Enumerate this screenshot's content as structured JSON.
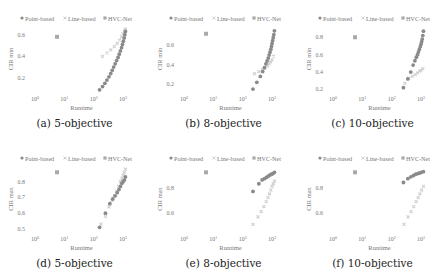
{
  "legend": {
    "items": [
      {
        "label": "Point-based",
        "color": "#8a8a8a",
        "marker": "circle"
      },
      {
        "label": "Line-based",
        "color": "#cfcfcf",
        "marker": "x"
      },
      {
        "label": "HVC-Net",
        "color": "#a9a9a9",
        "marker": "square"
      }
    ]
  },
  "colors": {
    "point": "#8a8a8a",
    "line": "#cfcfcf",
    "hvc": "#a9a9a9",
    "axis_text": "#777777",
    "caption": "#222222"
  },
  "chart_data": [
    {
      "id": "a",
      "caption": "(a) 5-objective",
      "type": "scatter",
      "xlabel": "Runtime",
      "ylabel": "CIR min",
      "xscale": "log",
      "xticks": [
        "10^0",
        "10^1",
        "10^2",
        "10^3"
      ],
      "xlim": [
        0,
        3.1
      ],
      "yticks": [
        0.2,
        0.4,
        0.6
      ],
      "ylim": [
        0.07,
        0.68
      ],
      "series": [
        {
          "name": "Point-based",
          "points": [
            [
              2.2,
              0.09
            ],
            [
              2.3,
              0.12
            ],
            [
              2.38,
              0.15
            ],
            [
              2.45,
              0.18
            ],
            [
              2.52,
              0.21
            ],
            [
              2.58,
              0.24
            ],
            [
              2.63,
              0.27
            ],
            [
              2.68,
              0.3
            ],
            [
              2.73,
              0.33
            ],
            [
              2.78,
              0.36
            ],
            [
              2.83,
              0.39
            ],
            [
              2.87,
              0.42
            ],
            [
              2.91,
              0.45
            ],
            [
              2.95,
              0.48
            ],
            [
              2.98,
              0.51
            ],
            [
              3.01,
              0.54
            ],
            [
              3.04,
              0.57
            ],
            [
              3.06,
              0.6
            ],
            [
              3.08,
              0.63
            ]
          ]
        },
        {
          "name": "Line-based",
          "points": [
            [
              2.3,
              0.4
            ],
            [
              2.45,
              0.43
            ],
            [
              2.58,
              0.46
            ],
            [
              2.7,
              0.49
            ],
            [
              2.8,
              0.52
            ],
            [
              2.88,
              0.55
            ],
            [
              2.95,
              0.58
            ],
            [
              3.0,
              0.61
            ],
            [
              3.05,
              0.63
            ],
            [
              3.08,
              0.65
            ]
          ]
        },
        {
          "name": "HVC-Net",
          "points": [
            [
              0.75,
              0.58
            ]
          ]
        }
      ]
    },
    {
      "id": "b",
      "caption": "(b) 8-objective",
      "type": "scatter",
      "xlabel": "Runtime",
      "ylabel": "CIR min",
      "xscale": "log",
      "xticks": [
        "10^0",
        "10^1",
        "10^2",
        "10^3"
      ],
      "xlim": [
        0,
        3.1
      ],
      "yticks": [
        0.2,
        0.4,
        0.6
      ],
      "ylim": [
        0.12,
        0.8
      ],
      "series": [
        {
          "name": "Point-based",
          "points": [
            [
              2.35,
              0.15
            ],
            [
              2.48,
              0.22
            ],
            [
              2.6,
              0.28
            ],
            [
              2.68,
              0.33
            ],
            [
              2.74,
              0.37
            ],
            [
              2.79,
              0.41
            ],
            [
              2.83,
              0.44
            ],
            [
              2.87,
              0.47
            ],
            [
              2.9,
              0.5
            ],
            [
              2.93,
              0.53
            ],
            [
              2.96,
              0.56
            ],
            [
              2.98,
              0.59
            ],
            [
              3.0,
              0.62
            ],
            [
              3.02,
              0.65
            ],
            [
              3.04,
              0.68
            ],
            [
              3.06,
              0.71
            ],
            [
              3.08,
              0.75
            ]
          ]
        },
        {
          "name": "Line-based",
          "points": [
            [
              2.4,
              0.31
            ],
            [
              2.55,
              0.33
            ],
            [
              2.67,
              0.35
            ],
            [
              2.76,
              0.37
            ],
            [
              2.84,
              0.39
            ],
            [
              2.9,
              0.41
            ],
            [
              2.95,
              0.43
            ],
            [
              3.0,
              0.45
            ],
            [
              3.05,
              0.49
            ]
          ]
        },
        {
          "name": "HVC-Net",
          "points": [
            [
              0.75,
              0.72
            ]
          ]
        }
      ]
    },
    {
      "id": "c",
      "caption": "(c) 10-objective",
      "type": "scatter",
      "xlabel": "Runtime",
      "ylabel": "CIR min",
      "xscale": "log",
      "xticks": [
        "10^0",
        "10^1",
        "10^2",
        "10^3"
      ],
      "xlim": [
        0,
        3.1
      ],
      "yticks": [
        0.2,
        0.4,
        0.6,
        0.8
      ],
      "ylim": [
        0.17,
        0.93
      ],
      "series": [
        {
          "name": "Point-based",
          "points": [
            [
              2.4,
              0.22
            ],
            [
              2.55,
              0.32
            ],
            [
              2.65,
              0.4
            ],
            [
              2.73,
              0.48
            ],
            [
              2.79,
              0.53
            ],
            [
              2.84,
              0.57
            ],
            [
              2.88,
              0.6
            ],
            [
              2.91,
              0.63
            ],
            [
              2.94,
              0.66
            ],
            [
              2.97,
              0.69
            ],
            [
              3.0,
              0.72
            ],
            [
              3.02,
              0.75
            ],
            [
              3.04,
              0.78
            ],
            [
              3.06,
              0.82
            ],
            [
              3.08,
              0.87
            ]
          ]
        },
        {
          "name": "Line-based",
          "points": [
            [
              2.45,
              0.27
            ],
            [
              2.58,
              0.33
            ],
            [
              2.7,
              0.35
            ],
            [
              2.8,
              0.37
            ],
            [
              2.88,
              0.39
            ],
            [
              2.95,
              0.41
            ],
            [
              3.0,
              0.42
            ],
            [
              3.06,
              0.44
            ]
          ]
        },
        {
          "name": "HVC-Net",
          "points": [
            [
              0.75,
              0.8
            ]
          ]
        }
      ]
    },
    {
      "id": "d",
      "caption": "(d) 5-objective",
      "type": "scatter",
      "xlabel": "Runtime",
      "ylabel": "CIR max",
      "xscale": "log",
      "xticks": [
        "10^0",
        "10^1",
        "10^2",
        "10^3"
      ],
      "xlim": [
        0,
        3.1
      ],
      "yticks": [
        0.5,
        0.6,
        0.7,
        0.8
      ],
      "ylim": [
        0.48,
        0.9
      ],
      "series": [
        {
          "name": "Point-based",
          "points": [
            [
              2.2,
              0.51
            ],
            [
              2.4,
              0.6
            ],
            [
              2.55,
              0.66
            ],
            [
              2.65,
              0.69
            ],
            [
              2.73,
              0.71
            ],
            [
              2.8,
              0.73
            ],
            [
              2.86,
              0.75
            ],
            [
              2.91,
              0.77
            ],
            [
              2.96,
              0.79
            ],
            [
              3.0,
              0.8
            ],
            [
              3.04,
              0.81
            ],
            [
              3.08,
              0.83
            ]
          ]
        },
        {
          "name": "Line-based",
          "points": [
            [
              2.25,
              0.53
            ],
            [
              2.4,
              0.58
            ],
            [
              2.52,
              0.64
            ],
            [
              2.62,
              0.68
            ],
            [
              2.7,
              0.71
            ],
            [
              2.78,
              0.74
            ],
            [
              2.85,
              0.77
            ],
            [
              2.91,
              0.8
            ],
            [
              2.96,
              0.82
            ],
            [
              3.0,
              0.84
            ],
            [
              3.04,
              0.86
            ],
            [
              3.08,
              0.88
            ]
          ]
        },
        {
          "name": "HVC-Net",
          "points": [
            [
              0.75,
              0.86
            ]
          ]
        }
      ]
    },
    {
      "id": "e",
      "caption": "(e) 8-objective",
      "type": "scatter",
      "xlabel": "Runtime",
      "ylabel": "CIR max",
      "xscale": "log",
      "xticks": [
        "10^0",
        "10^1",
        "10^2",
        "10^3"
      ],
      "xlim": [
        0,
        3.1
      ],
      "yticks": [
        0.6,
        0.8
      ],
      "ylim": [
        0.45,
        0.97
      ],
      "series": [
        {
          "name": "Point-based",
          "points": [
            [
              2.35,
              0.77
            ],
            [
              2.55,
              0.83
            ],
            [
              2.66,
              0.86
            ],
            [
              2.74,
              0.87
            ],
            [
              2.81,
              0.88
            ],
            [
              2.87,
              0.89
            ],
            [
              2.93,
              0.9
            ],
            [
              2.98,
              0.905
            ],
            [
              3.03,
              0.91
            ],
            [
              3.08,
              0.92
            ]
          ]
        },
        {
          "name": "Line-based",
          "points": [
            [
              2.35,
              0.51
            ],
            [
              2.52,
              0.57
            ],
            [
              2.63,
              0.61
            ],
            [
              2.72,
              0.65
            ],
            [
              2.8,
              0.69
            ],
            [
              2.86,
              0.72
            ],
            [
              2.91,
              0.75
            ],
            [
              2.96,
              0.78
            ],
            [
              3.0,
              0.81
            ],
            [
              3.04,
              0.83
            ],
            [
              3.08,
              0.85
            ]
          ]
        },
        {
          "name": "HVC-Net",
          "points": [
            [
              0.75,
              0.92
            ]
          ]
        }
      ]
    },
    {
      "id": "f",
      "caption": "(f) 10-objective",
      "type": "scatter",
      "xlabel": "Runtime",
      "ylabel": "CIR max",
      "xscale": "log",
      "xticks": [
        "10^0",
        "10^1",
        "10^2",
        "10^3"
      ],
      "xlim": [
        0,
        3.1
      ],
      "yticks": [
        0.6,
        0.8
      ],
      "ylim": [
        0.45,
        0.97
      ],
      "series": [
        {
          "name": "Point-based",
          "points": [
            [
              2.4,
              0.84
            ],
            [
              2.55,
              0.87
            ],
            [
              2.65,
              0.885
            ],
            [
              2.74,
              0.895
            ],
            [
              2.82,
              0.905
            ],
            [
              2.89,
              0.91
            ],
            [
              2.95,
              0.915
            ],
            [
              3.01,
              0.92
            ],
            [
              3.08,
              0.925
            ]
          ]
        },
        {
          "name": "Line-based",
          "points": [
            [
              2.42,
              0.51
            ],
            [
              2.56,
              0.57
            ],
            [
              2.66,
              0.61
            ],
            [
              2.75,
              0.65
            ],
            [
              2.83,
              0.69
            ],
            [
              2.9,
              0.72
            ],
            [
              2.96,
              0.75
            ],
            [
              3.02,
              0.78
            ],
            [
              3.08,
              0.81
            ]
          ]
        },
        {
          "name": "HVC-Net",
          "points": [
            [
              0.75,
              0.92
            ]
          ]
        }
      ]
    }
  ]
}
